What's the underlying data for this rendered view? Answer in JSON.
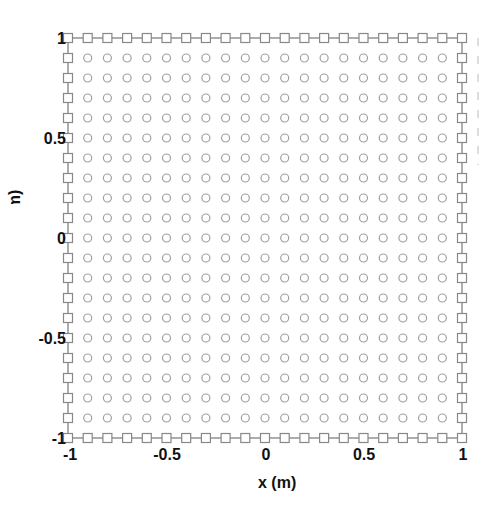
{
  "chart_data": {
    "type": "scatter",
    "title": "",
    "xlabel": "x (m)",
    "ylabel": "y (m)",
    "xlim": [
      -1,
      1
    ],
    "ylim": [
      -1,
      1
    ],
    "grid": false,
    "legend": null,
    "xticks": [
      "-1",
      "-0.5",
      "0",
      "0.5",
      "1"
    ],
    "yticks": [
      "1",
      "0.5",
      "0",
      "-0.5",
      "-1"
    ],
    "grid_points_per_side": 21,
    "spacing": 0.1,
    "series": [
      {
        "name": "boundary nodes",
        "marker": "square",
        "connected": true,
        "description": "Nodes on the square boundary x=±1 or y=±1, spacing 0.1 (80 points)",
        "x_values": [
          -1,
          -0.9,
          -0.8,
          -0.7,
          -0.6,
          -0.5,
          -0.4,
          -0.3,
          -0.2,
          -0.1,
          0,
          0.1,
          0.2,
          0.3,
          0.4,
          0.5,
          0.6,
          0.7,
          0.8,
          0.9,
          1
        ],
        "y_values": [
          -1,
          -0.9,
          -0.8,
          -0.7,
          -0.6,
          -0.5,
          -0.4,
          -0.3,
          -0.2,
          -0.1,
          0,
          0.1,
          0.2,
          0.3,
          0.4,
          0.5,
          0.6,
          0.7,
          0.8,
          0.9,
          1
        ]
      },
      {
        "name": "interior nodes",
        "marker": "circle",
        "connected": false,
        "description": "Interior grid nodes from -0.9 to 0.9 in both x and y, spacing 0.1 (361 points)",
        "x_values": [
          -0.9,
          -0.8,
          -0.7,
          -0.6,
          -0.5,
          -0.4,
          -0.3,
          -0.2,
          -0.1,
          0,
          0.1,
          0.2,
          0.3,
          0.4,
          0.5,
          0.6,
          0.7,
          0.8,
          0.9
        ],
        "y_values": [
          -0.9,
          -0.8,
          -0.7,
          -0.6,
          -0.5,
          -0.4,
          -0.3,
          -0.2,
          -0.1,
          0,
          0.1,
          0.2,
          0.3,
          0.4,
          0.5,
          0.6,
          0.7,
          0.8,
          0.9
        ]
      }
    ],
    "colors": {
      "boundary": "#888888",
      "interior": "#a0a0a0",
      "line": "#777777"
    }
  },
  "labels": {
    "x_axis": "x (m)",
    "y_axis": "y (m)",
    "xticks": [
      "-1",
      "-0.5",
      "0",
      "0.5",
      "1"
    ],
    "yticks": [
      "1",
      "0.5",
      "0",
      "-0.5",
      "-1"
    ]
  }
}
